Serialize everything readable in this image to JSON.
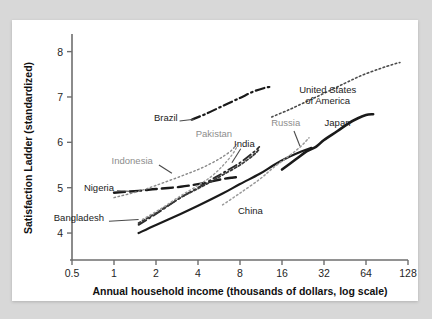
{
  "chart_data": {
    "type": "line",
    "title": "",
    "subtitle": "",
    "xlabel": "Annual household income (thousands of dollars, log scale)",
    "ylabel": "Satisfaction Ladder (standardized)",
    "xscale": "log2",
    "xticks": [
      0.5,
      1,
      2,
      4,
      8,
      16,
      32,
      64,
      128
    ],
    "xticklabels": [
      "0.5",
      "1",
      "2",
      "4",
      "8",
      "16",
      "32",
      "64",
      "128"
    ],
    "yticks": [
      4,
      5,
      6,
      7,
      8
    ],
    "yticklabels": [
      "4",
      "5",
      "6",
      "7",
      "8"
    ],
    "xlim": [
      0.5,
      128
    ],
    "ylim": [
      3.45,
      8.3
    ],
    "grid": false,
    "legend_position": "inline-annotations",
    "series": [
      {
        "name": "Japan",
        "style": "solid",
        "color": "#1a1a1a",
        "width": 2.6,
        "label_x": 40,
        "label_y": 6.35,
        "points": [
          [
            16,
            5.4
          ],
          [
            20,
            5.62
          ],
          [
            24,
            5.8
          ],
          [
            28,
            5.9
          ],
          [
            32,
            6.05
          ],
          [
            40,
            6.25
          ],
          [
            48,
            6.42
          ],
          [
            56,
            6.53
          ],
          [
            64,
            6.6
          ],
          [
            72,
            6.62
          ]
        ]
      },
      {
        "name": "China",
        "style": "solid",
        "color": "#1a1a1a",
        "width": 2.2,
        "label_x": 9.5,
        "label_y": 4.42,
        "points": [
          [
            1.5,
            4.0
          ],
          [
            2,
            4.18
          ],
          [
            3,
            4.42
          ],
          [
            4,
            4.6
          ],
          [
            6,
            4.87
          ],
          [
            8,
            5.08
          ],
          [
            11,
            5.3
          ],
          [
            14,
            5.5
          ],
          [
            18,
            5.68
          ],
          [
            22,
            5.8
          ],
          [
            26,
            5.88
          ]
        ]
      },
      {
        "name": "Nigeria",
        "style": "long-dash",
        "color": "#1a1a1a",
        "width": 2.4,
        "label_x": 0.78,
        "label_y": 4.93,
        "points": [
          [
            1,
            4.89
          ],
          [
            1.5,
            4.93
          ],
          [
            2,
            4.97
          ],
          [
            3,
            5.02
          ],
          [
            4,
            5.08
          ],
          [
            5,
            5.14
          ],
          [
            6,
            5.19
          ],
          [
            7,
            5.22
          ],
          [
            8,
            5.24
          ]
        ]
      },
      {
        "name": "India",
        "style": "dash-dot",
        "color": "#2a2a2a",
        "width": 1.8,
        "label_x": 8.6,
        "label_y": 5.9,
        "points": [
          [
            1.5,
            4.18
          ],
          [
            2,
            4.42
          ],
          [
            3,
            4.78
          ],
          [
            4,
            5.0
          ],
          [
            5,
            5.18
          ],
          [
            6,
            5.32
          ],
          [
            8,
            5.55
          ],
          [
            10,
            5.78
          ],
          [
            11,
            5.9
          ]
        ]
      },
      {
        "name": "Bangladesh",
        "style": "dotted-dense",
        "color": "#3a3a3a",
        "width": 1.8,
        "label_x": 0.56,
        "label_y": 4.26,
        "points": [
          [
            1.5,
            4.22
          ],
          [
            2,
            4.44
          ],
          [
            3,
            4.78
          ],
          [
            4,
            4.98
          ],
          [
            5,
            5.14
          ],
          [
            6,
            5.28
          ],
          [
            8,
            5.5
          ],
          [
            10,
            5.72
          ],
          [
            11,
            5.85
          ]
        ]
      },
      {
        "name": "Indonesia",
        "style": "dotted",
        "color": "#8a8a8a",
        "width": 1.4,
        "label_x": 1.35,
        "label_y": 5.52,
        "points": [
          [
            1,
            4.78
          ],
          [
            1.5,
            4.92
          ],
          [
            2,
            5.05
          ],
          [
            3,
            5.25
          ],
          [
            4,
            5.4
          ],
          [
            5,
            5.54
          ],
          [
            6,
            5.68
          ],
          [
            7,
            5.83
          ],
          [
            7.5,
            5.95
          ]
        ]
      },
      {
        "name": "Pakistan",
        "style": "dotted",
        "color": "#9a9a9a",
        "width": 1.4,
        "label_x": 5.2,
        "label_y": 6.12,
        "points": [
          [
            1.6,
            4.3
          ],
          [
            2.2,
            4.55
          ],
          [
            3,
            4.82
          ],
          [
            4,
            5.05
          ],
          [
            5,
            5.25
          ],
          [
            6,
            5.48
          ],
          [
            7,
            5.72
          ],
          [
            7.6,
            5.9
          ]
        ]
      },
      {
        "name": "Russia",
        "style": "dotted",
        "color": "#9a9a9a",
        "width": 1.5,
        "label_x": 17,
        "label_y": 6.35,
        "points": [
          [
            6,
            4.62
          ],
          [
            8,
            4.88
          ],
          [
            11,
            5.18
          ],
          [
            14,
            5.45
          ],
          [
            18,
            5.7
          ],
          [
            22,
            5.92
          ],
          [
            25,
            6.1
          ]
        ]
      },
      {
        "name": "Brazil",
        "style": "dash-dot",
        "color": "#1a1a1a",
        "width": 2.2,
        "label_x": 2.35,
        "label_y": 6.47,
        "points": [
          [
            3.6,
            6.5
          ],
          [
            4.5,
            6.62
          ],
          [
            6,
            6.8
          ],
          [
            8,
            6.98
          ],
          [
            10,
            7.12
          ],
          [
            12,
            7.2
          ],
          [
            13,
            7.22
          ]
        ]
      },
      {
        "name": "United States of America",
        "label_lines": [
          "United States",
          "of America"
        ],
        "style": "dotted",
        "color": "#4a4a4a",
        "width": 1.6,
        "label_x": 34,
        "label_y": 7.08,
        "points": [
          [
            13.5,
            6.56
          ],
          [
            18,
            6.72
          ],
          [
            24,
            6.9
          ],
          [
            32,
            7.08
          ],
          [
            45,
            7.3
          ],
          [
            60,
            7.48
          ],
          [
            80,
            7.62
          ],
          [
            100,
            7.72
          ],
          [
            112,
            7.76
          ]
        ]
      }
    ],
    "annotation_leaders": [
      {
        "name": "Brazil",
        "from": [
          2.95,
          6.47
        ],
        "to": [
          3.75,
          6.51
        ]
      },
      {
        "name": "Nigeria",
        "from": [
          1.05,
          4.93
        ],
        "to": [
          1.3,
          4.92
        ]
      },
      {
        "name": "Bangladesh",
        "from": [
          0.92,
          4.26
        ],
        "to": [
          1.5,
          4.3
        ]
      },
      {
        "name": "Russia",
        "from": [
          19.5,
          6.25
        ],
        "to": [
          21.5,
          5.92
        ]
      },
      {
        "name": "India",
        "from": [
          8.1,
          5.86
        ],
        "to": [
          7.0,
          5.55
        ]
      },
      {
        "name": "Indonesia",
        "from": [
          2.1,
          5.5
        ],
        "to": [
          2.6,
          5.32
        ]
      }
    ]
  }
}
